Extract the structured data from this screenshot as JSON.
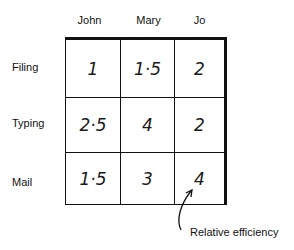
{
  "diagram": {
    "columns": [
      "John",
      "Mary",
      "Jo"
    ],
    "rows": [
      {
        "label": "Filing",
        "values": [
          "1",
          "1·5",
          "2"
        ]
      },
      {
        "label": "Typing",
        "values": [
          "2·5",
          "4",
          "2"
        ]
      },
      {
        "label": "Mail",
        "values": [
          "1·5",
          "3",
          "4"
        ]
      }
    ],
    "annotation": {
      "label": "Relative efficiency",
      "points_to": {
        "row": "Mail",
        "column": "Jo"
      }
    }
  }
}
